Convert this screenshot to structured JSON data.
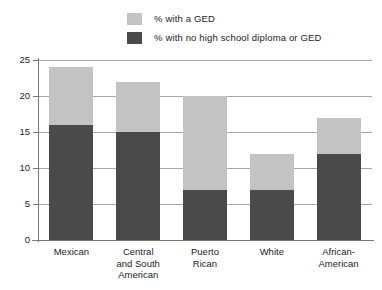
{
  "legend": {
    "items": [
      {
        "label": "% with a GED",
        "color": "#c3c3c3",
        "swatch_name": "legend-swatch-ged"
      },
      {
        "label": "% with no high school diploma or GED",
        "color": "#4a4a4a",
        "swatch_name": "legend-swatch-no-diploma"
      }
    ]
  },
  "axis": {
    "y_ticks": [
      "25",
      "20",
      "15",
      "10",
      "5",
      "0"
    ]
  },
  "categories_display": [
    "Mexican",
    "Central\nand South\nAmerican",
    "Puerto\nRican",
    "White",
    "African-\nAmerican"
  ],
  "chart_data": {
    "type": "bar",
    "subtype": "stacked",
    "title": "",
    "subtitle": "",
    "xlabel": "",
    "ylabel": "",
    "ylim": [
      0,
      25
    ],
    "yticks": [
      0,
      5,
      10,
      15,
      20,
      25
    ],
    "grid": true,
    "legend_position": "top",
    "categories": [
      "Mexican",
      "Central and South American",
      "Puerto Rican",
      "White",
      "African-American"
    ],
    "series": [
      {
        "name": "% with no high school diploma or GED",
        "color": "#4a4a4a",
        "values": [
          16,
          15,
          7,
          7,
          12
        ]
      },
      {
        "name": "% with a GED",
        "color": "#c3c3c3",
        "values": [
          8,
          7,
          13,
          5,
          5
        ]
      }
    ],
    "totals": [
      24,
      22,
      20,
      12,
      17
    ]
  }
}
